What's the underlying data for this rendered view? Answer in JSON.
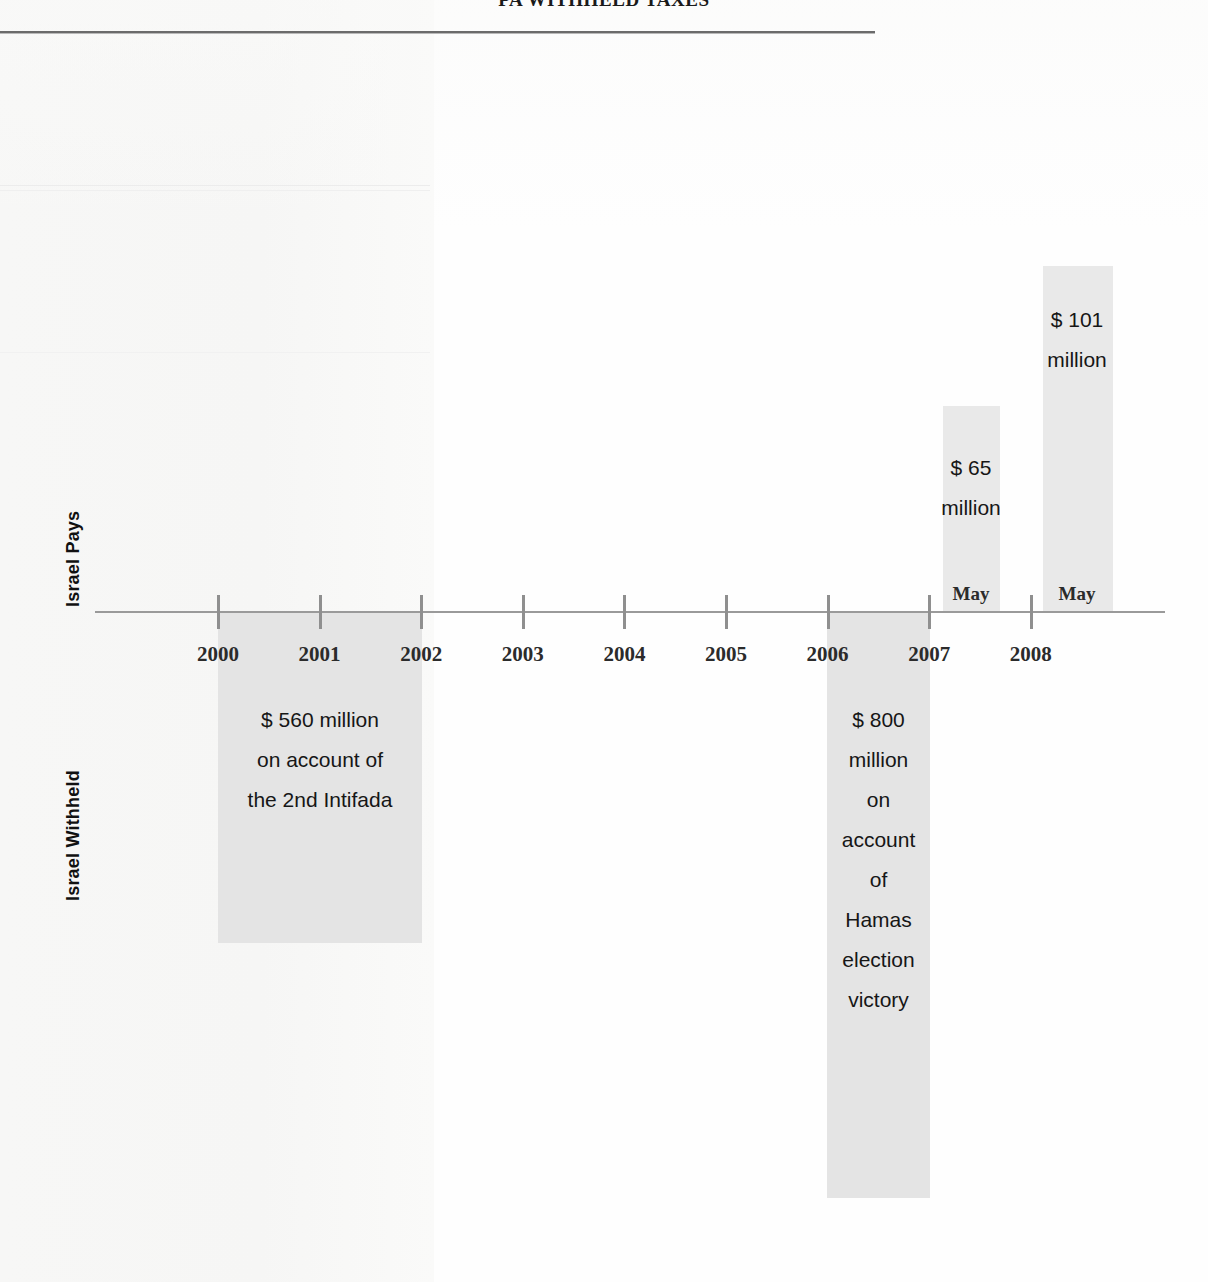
{
  "document": {
    "title": "PA WITHHELD TAXES"
  },
  "axis": {
    "label_above": "Israel Pays",
    "label_below": "Israel Withheld",
    "years": [
      "2000",
      "2001",
      "2002",
      "2003",
      "2004",
      "2005",
      "2006",
      "2007",
      "2008"
    ]
  },
  "events": {
    "withheld_2000": {
      "amount": "$ 560 million",
      "text": "$ 560 million\non account of\nthe 2nd Intifada"
    },
    "withheld_2006": {
      "amount": "$ 800 million",
      "text": "$ 800\nmillion\non\naccount\nof\nHamas\nelection\nvictory"
    },
    "paid_2007": {
      "amount": "$ 65 million",
      "text": "$ 65\nmillion",
      "month": "May"
    },
    "paid_2008": {
      "amount": "$ 101 million",
      "text": "$ 101\nmillion",
      "month": "May"
    }
  },
  "chart_data": {
    "type": "bar",
    "title": "PA WITHHELD TAXES",
    "xlabel": "",
    "ylabel": "",
    "orientation": "vertical-diverging-timeline",
    "categories": [
      "2000",
      "2001",
      "2002",
      "2003",
      "2004",
      "2005",
      "2006",
      "2007",
      "2008"
    ],
    "x": [
      2000,
      2001,
      2002,
      2003,
      2004,
      2005,
      2006,
      2007,
      2008
    ],
    "grid": false,
    "legend": null,
    "axis_labels": {
      "above_baseline": "Israel Pays",
      "below_baseline": "Israel Withheld"
    },
    "series": [
      {
        "name": "Israel Pays",
        "direction": "up",
        "unit": "USD million",
        "points": [
          {
            "label": "$ 65 million",
            "value": 65,
            "x_start": 2007,
            "x_end": 2007.5,
            "month": "May",
            "annotation": "$ 65 million"
          },
          {
            "label": "$ 101 million",
            "value": 101,
            "x_start": 2008,
            "x_end": 2008.5,
            "month": "May",
            "annotation": "$ 101 million"
          }
        ]
      },
      {
        "name": "Israel Withheld",
        "direction": "down",
        "unit": "USD million",
        "points": [
          {
            "label": "$ 560 million",
            "value": 560,
            "x_start": 2000,
            "x_end": 2002,
            "annotation": "$ 560 million on account of the 2nd Intifada"
          },
          {
            "label": "$ 800 million",
            "value": 800,
            "x_start": 2006,
            "x_end": 2007,
            "annotation": "$ 800 million on account of Hamas election victory"
          }
        ]
      }
    ]
  },
  "colors": {
    "bar_fill": "#e9e9e9",
    "axis": "#9a9a9a",
    "text": "#161616",
    "rule": "#6b6b6b"
  }
}
